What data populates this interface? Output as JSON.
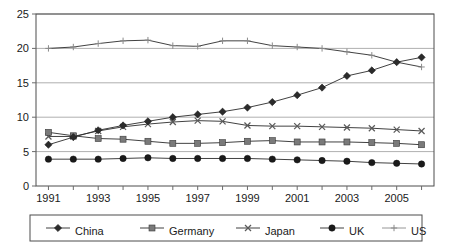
{
  "chart_data": {
    "type": "line",
    "title": "",
    "xlabel": "",
    "ylabel": "",
    "x": [
      1991,
      1992,
      1993,
      1994,
      1995,
      1996,
      1997,
      1998,
      1999,
      2000,
      2001,
      2002,
      2003,
      2004,
      2005,
      2006
    ],
    "xlim": [
      1990.5,
      2006.5
    ],
    "ylim": [
      0,
      25
    ],
    "y_ticks": [
      0,
      5,
      10,
      15,
      20,
      25
    ],
    "x_tick_labels": [
      "1991",
      "1993",
      "1995",
      "1997",
      "1999",
      "2001",
      "2003",
      "2005"
    ],
    "x_tick_values": [
      1991,
      1993,
      1995,
      1997,
      1999,
      2001,
      2003,
      2005
    ],
    "grid": true,
    "legend_position": "bottom",
    "series": [
      {
        "name": "China",
        "marker": "diamond",
        "color": "#2b2b2b",
        "values": [
          6.0,
          7.1,
          8.1,
          8.8,
          9.4,
          10.0,
          10.4,
          10.8,
          11.4,
          12.2,
          13.2,
          14.3,
          16.0,
          16.8,
          18.0,
          18.7
        ]
      },
      {
        "name": "Germany",
        "marker": "square",
        "color": "#7a7a7a",
        "values": [
          7.8,
          7.3,
          6.9,
          6.8,
          6.5,
          6.2,
          6.2,
          6.3,
          6.5,
          6.6,
          6.4,
          6.4,
          6.4,
          6.3,
          6.2,
          6.0
        ]
      },
      {
        "name": "Japan",
        "marker": "cross",
        "color": "#5a5a5a",
        "values": [
          7.2,
          7.2,
          8.0,
          8.6,
          9.0,
          9.3,
          9.5,
          9.4,
          8.8,
          8.7,
          8.7,
          8.6,
          8.5,
          8.4,
          8.2,
          8.0
        ]
      },
      {
        "name": "UK",
        "marker": "circle",
        "color": "#1a1a1a",
        "values": [
          3.9,
          3.9,
          3.9,
          4.0,
          4.1,
          4.0,
          4.0,
          4.0,
          4.0,
          3.9,
          3.8,
          3.7,
          3.6,
          3.4,
          3.3,
          3.2
        ]
      },
      {
        "name": "US",
        "marker": "plus",
        "color": "#8a8a8a",
        "values": [
          20.0,
          20.2,
          20.7,
          21.1,
          21.2,
          20.4,
          20.3,
          21.1,
          21.1,
          20.4,
          20.2,
          20.0,
          19.5,
          19.0,
          18.0,
          17.3
        ]
      }
    ]
  },
  "legend": {
    "items": [
      {
        "label": "China"
      },
      {
        "label": "Germany"
      },
      {
        "label": "Japan"
      },
      {
        "label": "UK"
      },
      {
        "label": "US"
      }
    ]
  }
}
